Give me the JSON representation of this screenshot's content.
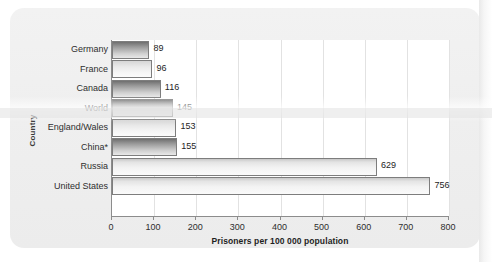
{
  "chart_data": {
    "type": "bar",
    "orientation": "horizontal",
    "title": "",
    "xlabel": "Prisoners per 100 000 population",
    "ylabel": "Country",
    "categories": [
      "Germany",
      "France",
      "Canada",
      "World",
      "England/Wales",
      "China*",
      "Russia",
      "United States"
    ],
    "values": [
      89,
      96,
      116,
      145,
      153,
      155,
      629,
      756
    ],
    "value_labels": [
      "89",
      "96",
      "116",
      "145",
      "153",
      "155",
      "629",
      "756"
    ],
    "xlim": [
      0,
      800
    ],
    "xticks": [
      0,
      100,
      200,
      300,
      400,
      500,
      600,
      700,
      800
    ],
    "xtick_labels": [
      "0",
      "100",
      "200",
      "300",
      "400",
      "500",
      "600",
      "700",
      "800"
    ],
    "grid": "vertical",
    "legend": "none",
    "bar_styles": [
      "dark",
      "light",
      "dark",
      "dark",
      "light",
      "dark",
      "verylight",
      "verylight"
    ],
    "colors": {
      "plot_background": "#ffffff",
      "page_background": "#efefef",
      "axis": "#8c8c8c",
      "gridline": "#e2e2e2",
      "text": "#2e2e2e",
      "bar_dark": "#6f6f6f",
      "bar_light": "#e9e9e9"
    }
  }
}
